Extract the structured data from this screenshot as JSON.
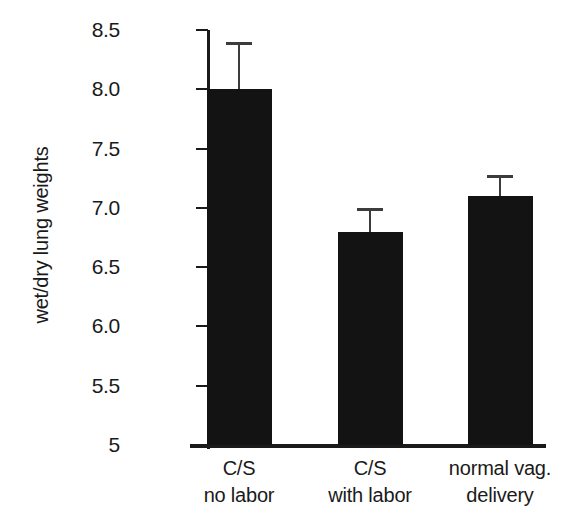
{
  "chart_data": {
    "type": "bar",
    "title": "",
    "subtitle": "",
    "xlabel": "",
    "ylabel": "wet/dry lung weights",
    "categories": [
      "C/S no labor",
      "C/S with labor",
      "normal vag. delivery"
    ],
    "category_lines": [
      [
        "C/S",
        "no labor"
      ],
      [
        "C/S",
        "with labor"
      ],
      [
        "normal vag.",
        "delivery"
      ]
    ],
    "values": [
      8.0,
      6.8,
      7.1
    ],
    "errors_upper": [
      0.4,
      0.2,
      0.18
    ],
    "errors_lower": [
      0,
      0,
      0
    ],
    "error_style": "upper-only",
    "ylim": [
      5,
      8.5
    ],
    "ytick_values": [
      5,
      5.5,
      6,
      6.5,
      7,
      7.5,
      8,
      8.5
    ],
    "ytick_labels": [
      "5",
      "5.5",
      "6.0",
      "6.5",
      "7.0",
      "7.5",
      "8.0",
      "8.5"
    ],
    "grid": false,
    "legend": null,
    "legend_position": "none",
    "bar_color": "#131313",
    "axis_color": "#1a1a1a",
    "error_color": "#3c3c3c",
    "background_color": "#ffffff"
  }
}
